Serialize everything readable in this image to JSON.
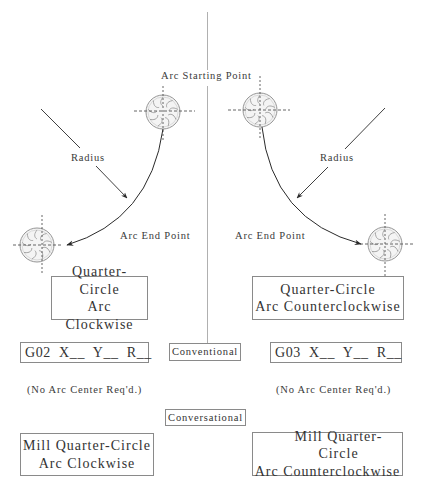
{
  "diagram": {
    "labels": {
      "arc_start": "Arc Starting Point",
      "radius_left": "Radius",
      "radius_right": "Radius",
      "arc_end_left": "Arc End Point",
      "arc_end_right": "Arc End Point"
    },
    "left": {
      "title_box": {
        "line1": "Quarter-Circle",
        "line2": "Arc Clockwise"
      },
      "code_box": "G02  X__  Y__  R__",
      "note": "(No Arc Center Req'd.)",
      "mill_box": {
        "line1": "Mill Quarter-Circle",
        "line2": "Arc Clockwise"
      }
    },
    "right": {
      "title_box": {
        "line1": "Quarter-Circle",
        "line2": "Arc Counterclockwise"
      },
      "code_box": "G03  X__  Y__  R__",
      "note": "(No Arc Center Req'd.)",
      "mill_box": {
        "line1": "Mill Quarter-Circle",
        "line2": "Arc Counterclockwise"
      }
    },
    "center": {
      "conventional_tag": "Conventional",
      "conversational_tag": "Conversational"
    },
    "icons": {
      "cutter": "end-mill-cutter-icon",
      "arrow": "arrow-head-icon"
    },
    "colors": {
      "line": "#2a2a2a",
      "dashed": "#555555",
      "box_border": "#8a8a8a",
      "divider": "#b0b0b0",
      "cutter_stroke": "#888888"
    }
  }
}
